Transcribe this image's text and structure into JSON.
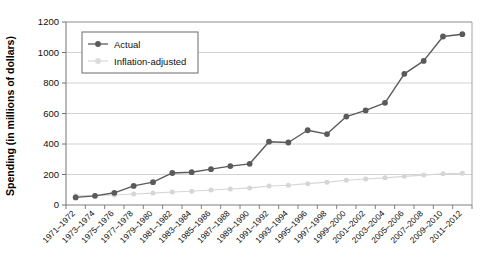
{
  "chart_data": {
    "type": "line",
    "title": "",
    "xlabel": "",
    "ylabel": "Spending (in millions of dollars)",
    "ylim": [
      0,
      1200
    ],
    "ytick_values": [
      0,
      200,
      400,
      600,
      800,
      1000,
      1200
    ],
    "ytick_labels": [
      "0",
      "200",
      "400",
      "600",
      "800",
      "1000",
      "1200"
    ],
    "grid": "horizontal",
    "legend_position": "upper-left",
    "categories": [
      "1971–1972",
      "1973–1974",
      "1975–1976",
      "1977–1978",
      "1979–1980",
      "1981–1982",
      "1983–1984",
      "1985–1986",
      "1987–1988",
      "1989–1990",
      "1991–1992",
      "1993–1994",
      "1995–1996",
      "1997–1998",
      "1999–2000",
      "2001–2002",
      "2003–2004",
      "2005–2006",
      "2007–2008",
      "2009–2010",
      "2011–2012"
    ],
    "series": [
      {
        "name": "Actual",
        "color": "#5a5a5a",
        "marker": "circle",
        "values": [
          50,
          60,
          80,
          125,
          150,
          210,
          215,
          235,
          255,
          270,
          415,
          410,
          490,
          465,
          580,
          620,
          670,
          860,
          945,
          1105,
          1120
        ]
      },
      {
        "name": "Inflation-adjusted",
        "color": "#d6d6d6",
        "marker": "circle",
        "values": [
          60,
          62,
          66,
          72,
          78,
          85,
          90,
          98,
          105,
          112,
          125,
          130,
          140,
          150,
          162,
          170,
          178,
          188,
          196,
          205,
          208
        ]
      }
    ]
  },
  "legend": {
    "entries": [
      {
        "label": "Actual"
      },
      {
        "label": "Inflation-adjusted"
      }
    ]
  },
  "axes": {
    "y_title": "Spending (in millions of dollars)"
  }
}
